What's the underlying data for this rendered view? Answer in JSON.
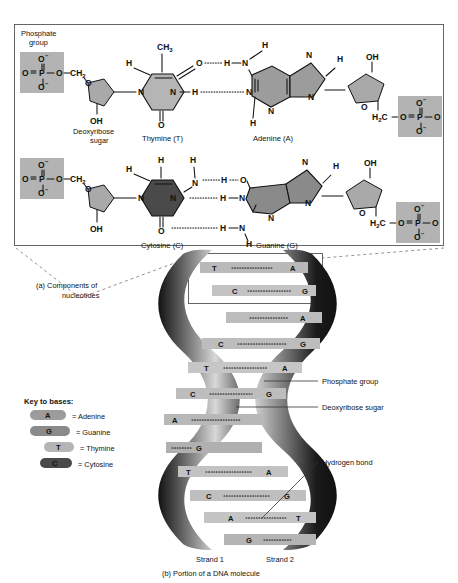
{
  "figure": {
    "top_fragment": "",
    "panel_a": {
      "caption_line1": "(a) Components of",
      "caption_line2": "nucleotides",
      "labels": {
        "phosphate_line1": "Phosphate",
        "phosphate_line2": "group",
        "deoxyribose_line1": "Deoxyribose",
        "deoxyribose_line2": "sugar",
        "hydroxyl": "OH"
      },
      "pair_top": {
        "left_base_label": "Thymine (T)",
        "right_base_label": "Adenine (A)",
        "methyl": "CH3",
        "sugar_ch2": "CH2",
        "sugar_h2c": "H2C",
        "sugar_oh": "OH",
        "ring_o": "O",
        "phosphate_p": "P",
        "phosphate_o": "O",
        "phosphate_o_minus": "O",
        "n": "N",
        "h": "H"
      },
      "pair_bottom": {
        "left_base_label": "Cytosine (C)",
        "right_base_label": "Guanine (G)",
        "sugar_ch2": "CH2",
        "sugar_h2c": "H2C",
        "sugar_oh": "OH",
        "ring_o": "O",
        "phosphate_p": "P",
        "phosphate_o": "O",
        "n": "N",
        "h": "H"
      }
    },
    "panel_b": {
      "caption": "(b) Portion of a DNA molecule",
      "strand_left": "Strand 1",
      "strand_right": "Strand 2",
      "callouts": [
        "Phosphate group",
        "Deoxyribose sugar",
        "Hydrogen bond"
      ],
      "key": {
        "title": "Key to bases:",
        "items": [
          {
            "symbol": "A",
            "text": "= Adenine",
            "color": "#9c9c9c"
          },
          {
            "symbol": "G",
            "text": "= Guanine",
            "color": "#8a8a8a"
          },
          {
            "symbol": "T",
            "text": "= Thymine",
            "color": "#b5b5b5"
          },
          {
            "symbol": "C",
            "text": "= Cytosine",
            "color": "#4a4a4a"
          }
        ]
      },
      "base_pairs": [
        {
          "left": "T",
          "right": "A"
        },
        {
          "left": "C",
          "right": "G"
        },
        {
          "left": "",
          "right": "A"
        },
        {
          "left": "C",
          "right": "G"
        },
        {
          "left": "T",
          "right": "A"
        },
        {
          "left": "C",
          "right": "G"
        },
        {
          "left": "A",
          "right": ""
        },
        {
          "left": "",
          "right": "G"
        },
        {
          "left": "T",
          "right": "A"
        },
        {
          "left": "C",
          "right": "G"
        },
        {
          "left": "A",
          "right": "T"
        },
        {
          "left": "G",
          "right": ""
        }
      ]
    },
    "colors": {
      "phosphate_fill": "#b3b3b3",
      "sugar_fill": "#a9a9a9",
      "thymine_fill": "#b5b5b5",
      "adenine_fill": "#9c9c9c",
      "cytosine_fill": "#4a4a4a",
      "guanine_fill": "#8a8a8a",
      "box_stroke": "#555555",
      "ribbon_dark": "#111111",
      "ribbon_light": "#c0c0c0"
    }
  }
}
